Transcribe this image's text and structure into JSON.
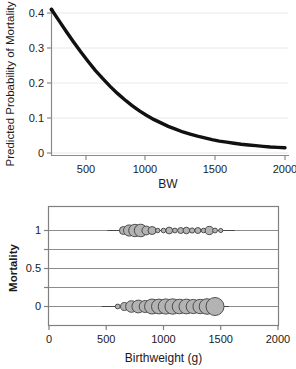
{
  "figure": {
    "background": "#ffffff",
    "panels": [
      "top",
      "bottom"
    ]
  },
  "chart_data": [
    {
      "id": "predicted-probability-curve",
      "type": "line",
      "title": "",
      "xlabel": "BW",
      "ylabel": "Predicted Probability of Mortality",
      "xlim": [
        400,
        2000
      ],
      "ylim": [
        0,
        0.41
      ],
      "xticks": [
        500,
        1000,
        1500,
        2000
      ],
      "xtick_labels": [
        "500",
        "1000",
        "1500",
        "2000"
      ],
      "yticks": [
        0,
        0.1,
        0.2,
        0.3,
        0.4
      ],
      "ytick_labels": [
        "0",
        "0.1",
        "0.2",
        "0.3",
        "0.4"
      ],
      "grid": "horizontal",
      "grid_color": "#e6e6e6",
      "line_color": "#111111",
      "line_width": 3.4,
      "series": [
        {
          "name": "Predicted probability of mortality",
          "x": [
            400,
            450,
            500,
            550,
            600,
            650,
            700,
            750,
            800,
            850,
            900,
            950,
            1000,
            1050,
            1100,
            1150,
            1200,
            1250,
            1300,
            1350,
            1400,
            1450,
            1500,
            1550,
            1600,
            1650,
            1700,
            1750,
            1800,
            1850,
            1900,
            1950,
            2000
          ],
          "y": [
            0.41,
            0.379,
            0.348,
            0.318,
            0.289,
            0.262,
            0.236,
            0.213,
            0.191,
            0.171,
            0.153,
            0.136,
            0.121,
            0.108,
            0.096,
            0.086,
            0.076,
            0.068,
            0.06,
            0.054,
            0.048,
            0.043,
            0.038,
            0.034,
            0.031,
            0.028,
            0.025,
            0.023,
            0.021,
            0.019,
            0.017,
            0.016,
            0.015
          ]
        }
      ]
    },
    {
      "id": "mortality-bubble-plot",
      "type": "scatter",
      "title": "",
      "xlabel": "Birthweight (g)",
      "ylabel": "Mortality",
      "xlim": [
        0,
        2000
      ],
      "ylim": [
        -0.22,
        1.22
      ],
      "xticks": [
        0,
        500,
        1000,
        1500,
        2000
      ],
      "xtick_labels": [
        "0",
        "500",
        "1000",
        "1500",
        "2000"
      ],
      "yticks": [
        0,
        0.25,
        0.5,
        0.75,
        1
      ],
      "ytick_labels": [
        "0",
        "",
        "0.5",
        "",
        "1"
      ],
      "grid": "horizontal",
      "grid_color": "#8c8c8c",
      "frame_color": "#808080",
      "bubble_fill": "#b3b3b3",
      "bubble_stroke": "#404040",
      "series": [
        {
          "name": "Mortality = 1",
          "y": 1,
          "points": [
            {
              "x": 650,
              "r": 4.0
            },
            {
              "x": 700,
              "r": 5.6
            },
            {
              "x": 750,
              "r": 6.2
            },
            {
              "x": 800,
              "r": 6.3
            },
            {
              "x": 850,
              "r": 4.4
            },
            {
              "x": 900,
              "r": 4.0
            },
            {
              "x": 950,
              "r": 2.2
            },
            {
              "x": 1000,
              "r": 2.3
            },
            {
              "x": 1050,
              "r": 3.4
            },
            {
              "x": 1100,
              "r": 2.4
            },
            {
              "x": 1150,
              "r": 3.0
            },
            {
              "x": 1200,
              "r": 3.3
            },
            {
              "x": 1250,
              "r": 2.6
            },
            {
              "x": 1300,
              "r": 3.0
            },
            {
              "x": 1350,
              "r": 2.3
            },
            {
              "x": 1400,
              "r": 4.1
            },
            {
              "x": 1450,
              "r": 2.4
            },
            {
              "x": 1500,
              "r": 2.1
            }
          ]
        },
        {
          "name": "Mortality = 0",
          "y": 0,
          "points": [
            {
              "x": 600,
              "r": 2.4
            },
            {
              "x": 660,
              "r": 4.0
            },
            {
              "x": 720,
              "r": 5.8
            },
            {
              "x": 780,
              "r": 6.4
            },
            {
              "x": 840,
              "r": 6.0
            },
            {
              "x": 900,
              "r": 7.5
            },
            {
              "x": 960,
              "r": 7.4
            },
            {
              "x": 1020,
              "r": 7.6
            },
            {
              "x": 1080,
              "r": 7.7
            },
            {
              "x": 1140,
              "r": 7.3
            },
            {
              "x": 1200,
              "r": 7.4
            },
            {
              "x": 1260,
              "r": 7.1
            },
            {
              "x": 1320,
              "r": 7.2
            },
            {
              "x": 1380,
              "r": 7.8
            },
            {
              "x": 1450,
              "r": 9.0
            }
          ]
        }
      ]
    }
  ],
  "top_chart": {
    "ylabel": "Predicted Probability of Mortality",
    "xlabel": "BW",
    "ytick_labels": [
      "0.4",
      "0.3",
      "0.2",
      "0.1",
      "0"
    ],
    "xtick_labels": [
      "500",
      "1000",
      "1500",
      "2000"
    ]
  },
  "bottom_chart": {
    "ylabel": "Mortality",
    "xlabel": "Birthweight (g)",
    "ytick_labels": [
      "1",
      "0.5",
      "0"
    ],
    "xtick_labels": [
      "0",
      "500",
      "1000",
      "1500",
      "2000"
    ]
  }
}
